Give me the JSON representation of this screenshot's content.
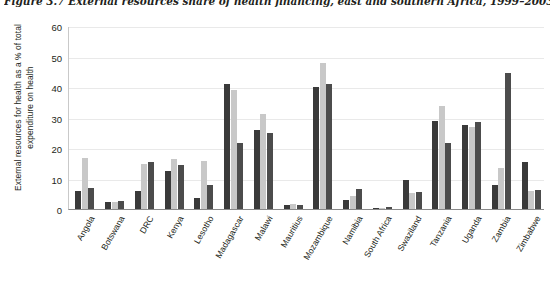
{
  "figure": {
    "title": "Figure 3.7 External resources share of health financing, east and southern Africa, 1999–2003"
  },
  "chart_data": {
    "type": "bar",
    "title": "Figure 3.7 External resources share of health financing, east and southern Africa, 1999–2003",
    "xlabel": "",
    "ylabel": "External resources for health as a % of total expenditure on health",
    "ylim": [
      0,
      60
    ],
    "yticks": [
      0,
      10,
      20,
      30,
      40,
      50,
      60
    ],
    "ytick_labels": [
      "0",
      "10",
      "20",
      "30",
      "40",
      "50",
      "60"
    ],
    "grid": true,
    "legend": "none",
    "categories": [
      "Angola",
      "Botswana",
      "DRC",
      "Kenya",
      "Lesotho",
      "Madagascar",
      "Malawi",
      "Mauritius",
      "Mozambique",
      "Namibia",
      "South Africa",
      "Swaziland",
      "Tanzania",
      "Uganda",
      "Zambia",
      "Zimbabwe"
    ],
    "series": [
      {
        "name": "1999",
        "color": "#3a3a3a",
        "values": [
          5.8,
          2.4,
          5.8,
          12.5,
          3.5,
          41.0,
          26.0,
          1.3,
          40.0,
          3.0,
          0.3,
          9.5,
          28.8,
          27.5,
          8.0,
          15.5
        ]
      },
      {
        "name": "2001",
        "color": "#c8c8c8",
        "values": [
          16.8,
          2.4,
          14.8,
          16.3,
          15.7,
          39.0,
          31.0,
          1.6,
          48.0,
          4.3,
          0.4,
          5.2,
          33.8,
          27.0,
          13.5,
          6.0
        ]
      },
      {
        "name": "2003",
        "color": "#4c4c4c",
        "values": [
          6.8,
          2.7,
          15.3,
          14.3,
          7.8,
          21.5,
          24.8,
          1.2,
          41.0,
          6.4,
          0.5,
          5.5,
          21.8,
          28.5,
          44.5,
          6.3
        ]
      }
    ]
  }
}
